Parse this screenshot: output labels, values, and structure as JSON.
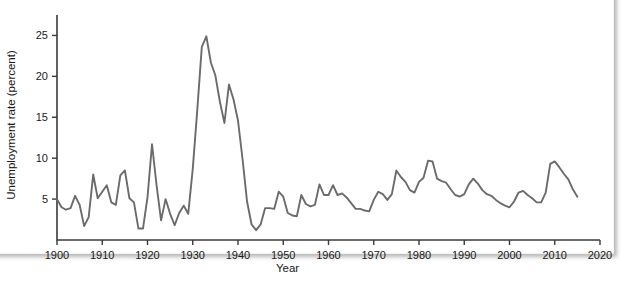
{
  "chart_data": {
    "type": "line",
    "title": "",
    "xlabel": "Year",
    "ylabel": "Unemployment rate (percent)",
    "xlim": [
      1900,
      2020
    ],
    "ylim": [
      0,
      27.5
    ],
    "xticks": [
      1900,
      1910,
      1920,
      1930,
      1940,
      1950,
      1960,
      1970,
      1980,
      1990,
      2000,
      2010,
      2020
    ],
    "yticks": [
      5,
      10,
      15,
      20,
      25
    ],
    "grid": false,
    "legend": null,
    "line_color": "#6b6b6b",
    "series": [
      {
        "name": "Unemployment rate",
        "x": [
          1900,
          1901,
          1902,
          1903,
          1904,
          1905,
          1906,
          1907,
          1908,
          1909,
          1910,
          1911,
          1912,
          1913,
          1914,
          1915,
          1916,
          1917,
          1918,
          1919,
          1920,
          1921,
          1922,
          1923,
          1924,
          1925,
          1926,
          1927,
          1928,
          1929,
          1930,
          1931,
          1932,
          1933,
          1934,
          1935,
          1936,
          1937,
          1938,
          1939,
          1940,
          1941,
          1942,
          1943,
          1944,
          1945,
          1946,
          1947,
          1948,
          1949,
          1950,
          1951,
          1952,
          1953,
          1954,
          1955,
          1956,
          1957,
          1958,
          1959,
          1960,
          1961,
          1962,
          1963,
          1964,
          1965,
          1966,
          1967,
          1968,
          1969,
          1970,
          1971,
          1972,
          1973,
          1974,
          1975,
          1976,
          1977,
          1978,
          1979,
          1980,
          1981,
          1982,
          1983,
          1984,
          1985,
          1986,
          1987,
          1988,
          1989,
          1990,
          1991,
          1992,
          1993,
          1994,
          1995,
          1996,
          1997,
          1998,
          1999,
          2000,
          2001,
          2002,
          2003,
          2004,
          2005,
          2006,
          2007,
          2008,
          2009,
          2010,
          2011,
          2012,
          2013,
          2014,
          2015
        ],
        "values": [
          5.0,
          4.0,
          3.7,
          3.9,
          5.4,
          4.3,
          1.7,
          2.8,
          8.0,
          5.1,
          5.9,
          6.7,
          4.6,
          4.3,
          7.9,
          8.5,
          5.1,
          4.6,
          1.4,
          1.4,
          5.2,
          11.7,
          6.7,
          2.4,
          5.0,
          3.2,
          1.8,
          3.3,
          4.2,
          3.2,
          8.7,
          15.9,
          23.6,
          24.9,
          21.7,
          20.1,
          16.9,
          14.3,
          19.0,
          17.2,
          14.6,
          9.9,
          4.7,
          1.9,
          1.2,
          1.9,
          3.9,
          3.9,
          3.8,
          5.9,
          5.3,
          3.3,
          3.0,
          2.9,
          5.5,
          4.4,
          4.1,
          4.3,
          6.8,
          5.5,
          5.5,
          6.7,
          5.5,
          5.7,
          5.2,
          4.5,
          3.8,
          3.8,
          3.6,
          3.5,
          4.9,
          5.9,
          5.6,
          4.9,
          5.6,
          8.5,
          7.7,
          7.1,
          6.1,
          5.8,
          7.1,
          7.6,
          9.7,
          9.6,
          7.5,
          7.2,
          7.0,
          6.2,
          5.5,
          5.3,
          5.6,
          6.8,
          7.5,
          6.9,
          6.1,
          5.6,
          5.4,
          4.9,
          4.5,
          4.2,
          4.0,
          4.7,
          5.8,
          6.0,
          5.5,
          5.1,
          4.6,
          4.6,
          5.8,
          9.3,
          9.6,
          8.9,
          8.1,
          7.4,
          6.2,
          5.3
        ]
      }
    ]
  },
  "axis": {
    "x_title": "Year",
    "y_title": "Unemployment rate (percent)",
    "x_tick_labels": [
      "1900",
      "1910",
      "1920",
      "1930",
      "1940",
      "1950",
      "1960",
      "1970",
      "1980",
      "1990",
      "2000",
      "2010",
      "2020"
    ],
    "y_tick_labels": [
      "5",
      "10",
      "15",
      "20",
      "25"
    ]
  }
}
